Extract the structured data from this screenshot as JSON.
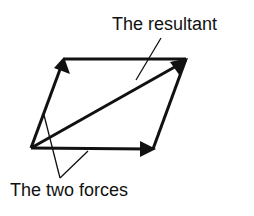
{
  "diagram": {
    "labels": {
      "resultant": "The resultant",
      "forces": "The two forces"
    },
    "colors": {
      "stroke": "#111111",
      "background": "#ffffff"
    },
    "points": {
      "origin": [
        31,
        148
      ],
      "top_left": [
        64,
        59
      ],
      "top_right": [
        186,
        59
      ],
      "bottom_right": [
        153,
        149
      ]
    },
    "vectors": [
      {
        "name": "force-1",
        "from": "origin",
        "to": "top_left"
      },
      {
        "name": "force-2",
        "from": "origin",
        "to": "bottom_right"
      },
      {
        "name": "resultant",
        "from": "origin",
        "to": "top_right"
      }
    ]
  }
}
